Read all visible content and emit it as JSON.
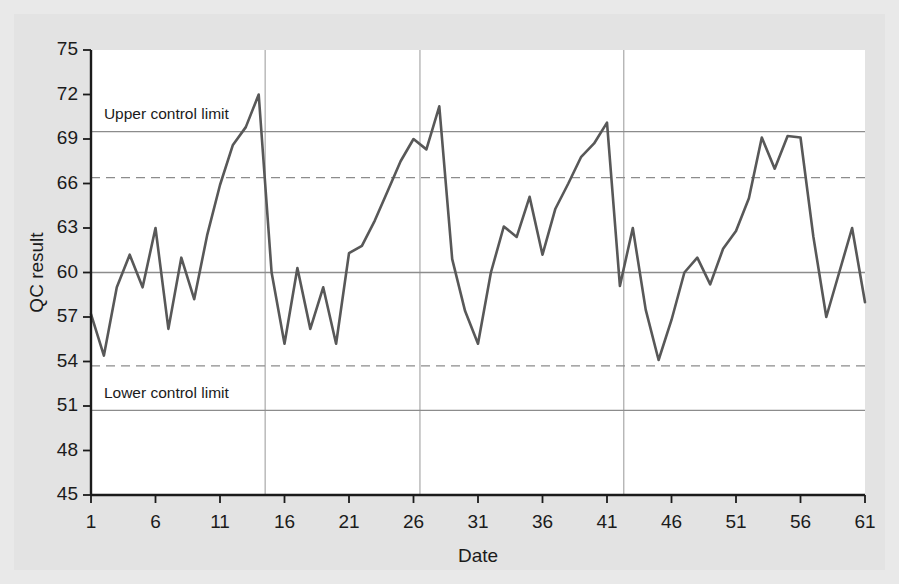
{
  "figure": {
    "background_color": "#e9e9e9",
    "plot_background_color": "#ffffff"
  },
  "chart_data": {
    "type": "line",
    "title": "",
    "subtitle": "",
    "xlabel": "Date",
    "ylabel": "QC result",
    "xlim": [
      1,
      61
    ],
    "ylim": [
      45,
      75
    ],
    "grid": true,
    "legend_position": "none",
    "line_color": "#585858",
    "x_ticks": [
      1,
      6,
      11,
      16,
      21,
      26,
      31,
      36,
      41,
      46,
      51,
      56,
      61
    ],
    "y_ticks": [
      45,
      48,
      51,
      54,
      57,
      60,
      63,
      66,
      69,
      72,
      75
    ],
    "x_tick_labels": [
      "1",
      "6",
      "11",
      "16",
      "21",
      "26",
      "31",
      "36",
      "41",
      "46",
      "51",
      "56",
      "61"
    ],
    "y_tick_labels": [
      "45",
      "48",
      "51",
      "54",
      "57",
      "60",
      "63",
      "66",
      "69",
      "72",
      "75"
    ],
    "reference_lines": [
      {
        "name": "upper-control-limit",
        "label": "Upper control limit",
        "value": 69.5,
        "style": "solid",
        "color": "#8c8c8c",
        "label_x": 2.0,
        "label_y": 70.6
      },
      {
        "name": "upper-warning-limit",
        "label": "",
        "value": 66.4,
        "style": "dashed",
        "color": "#8c8c8c"
      },
      {
        "name": "center-line",
        "label": "",
        "value": 60.0,
        "style": "solid",
        "color": "#8c8c8c"
      },
      {
        "name": "lower-warning-limit",
        "label": "",
        "value": 53.7,
        "style": "dashed",
        "color": "#8c8c8c"
      },
      {
        "name": "lower-control-limit",
        "label": "Lower control limit",
        "value": 50.7,
        "style": "solid",
        "color": "#8c8c8c",
        "label_x": 2.0,
        "label_y": 51.8
      }
    ],
    "vertical_gridlines": [
      14.5,
      26.5,
      42.3
    ],
    "x": [
      1,
      2,
      3,
      4,
      5,
      6,
      7,
      8,
      9,
      10,
      11,
      12,
      13,
      14,
      15,
      16,
      17,
      18,
      19,
      20,
      21,
      22,
      23,
      24,
      25,
      26,
      27,
      28,
      29,
      30,
      31,
      32,
      33,
      34,
      35,
      36,
      37,
      38,
      39,
      40,
      41,
      42,
      43,
      44,
      45,
      46,
      47,
      48,
      49,
      50,
      51,
      52,
      53,
      54,
      55,
      56,
      57,
      58,
      59,
      60,
      61
    ],
    "values": [
      57.2,
      54.4,
      59.0,
      61.2,
      59.0,
      63.0,
      56.2,
      61.0,
      58.2,
      62.5,
      65.9,
      68.6,
      69.8,
      72.0,
      60.0,
      55.2,
      60.3,
      56.2,
      59.0,
      55.2,
      61.3,
      61.8,
      63.5,
      65.5,
      67.5,
      69.0,
      68.3,
      71.2,
      60.9,
      57.4,
      55.2,
      60.0,
      63.1,
      62.4,
      65.1,
      61.2,
      64.3,
      66.0,
      67.8,
      68.7,
      70.1,
      59.1,
      63.0,
      57.5,
      54.1,
      56.8,
      60.0,
      61.0,
      59.2,
      61.6,
      62.8,
      65.0,
      69.1,
      67.0,
      69.2,
      69.1,
      62.4,
      57.0,
      60.0,
      63.0,
      58.0
    ]
  }
}
